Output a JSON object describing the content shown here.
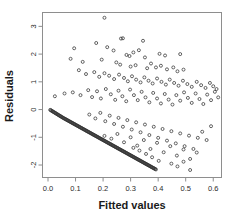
{
  "chart_data": {
    "type": "scatter",
    "title": "",
    "xlabel": "Fitted values",
    "ylabel": "Residuals",
    "xlim": [
      -0.02,
      0.63
    ],
    "ylim": [
      -2.45,
      3.5
    ],
    "xticks": [
      0.0,
      0.1,
      0.2,
      0.3,
      0.4,
      0.5,
      0.6
    ],
    "xticklabels": [
      "0.0",
      "0.1",
      "0.2",
      "0.3",
      "0.4",
      "0.5",
      "0.6"
    ],
    "yticks": [
      3,
      2,
      1,
      0,
      -1,
      -2
    ],
    "yticklabels": [
      "3",
      "2",
      "1",
      "0",
      "-1",
      "-2"
    ],
    "grid": false,
    "legend": null,
    "marker": "open-circle",
    "marker_size": 3.0,
    "marker_color": "#333333",
    "n_points": 404,
    "points": [
      [
        0.205,
        3.31
      ],
      [
        0.265,
        2.56
      ],
      [
        0.272,
        2.57
      ],
      [
        0.345,
        2.48
      ],
      [
        0.175,
        2.4
      ],
      [
        0.095,
        2.21
      ],
      [
        0.215,
        2.25
      ],
      [
        0.238,
        2.13
      ],
      [
        0.31,
        2.06
      ],
      [
        0.33,
        2.14
      ],
      [
        0.405,
        2.01
      ],
      [
        0.285,
        1.97
      ],
      [
        0.296,
        1.93
      ],
      [
        0.352,
        1.88
      ],
      [
        0.425,
        1.95
      ],
      [
        0.48,
        2.0
      ],
      [
        0.082,
        1.83
      ],
      [
        0.126,
        1.72
      ],
      [
        0.195,
        1.8
      ],
      [
        0.248,
        1.7
      ],
      [
        0.262,
        1.62
      ],
      [
        0.3,
        1.55
      ],
      [
        0.318,
        1.6
      ],
      [
        0.36,
        1.49
      ],
      [
        0.374,
        1.66
      ],
      [
        0.392,
        1.52
      ],
      [
        0.41,
        1.58
      ],
      [
        0.432,
        1.45
      ],
      [
        0.455,
        1.52
      ],
      [
        0.47,
        1.38
      ],
      [
        0.492,
        1.44
      ],
      [
        0.112,
        1.42
      ],
      [
        0.138,
        1.28
      ],
      [
        0.168,
        1.35
      ],
      [
        0.186,
        1.18
      ],
      [
        0.205,
        1.31
      ],
      [
        0.222,
        1.22
      ],
      [
        0.24,
        1.1
      ],
      [
        0.258,
        1.26
      ],
      [
        0.276,
        1.14
      ],
      [
        0.29,
        1.02
      ],
      [
        0.305,
        1.2
      ],
      [
        0.32,
        1.08
      ],
      [
        0.336,
        0.98
      ],
      [
        0.35,
        1.16
      ],
      [
        0.365,
        1.04
      ],
      [
        0.38,
        0.94
      ],
      [
        0.396,
        1.12
      ],
      [
        0.412,
        1.0
      ],
      [
        0.428,
        0.9
      ],
      [
        0.442,
        1.08
      ],
      [
        0.458,
        0.96
      ],
      [
        0.474,
        0.86
      ],
      [
        0.49,
        1.04
      ],
      [
        0.506,
        0.92
      ],
      [
        0.522,
        0.82
      ],
      [
        0.54,
        1.0
      ],
      [
        0.556,
        0.88
      ],
      [
        0.572,
        0.78
      ],
      [
        0.588,
        0.96
      ],
      [
        0.6,
        0.84
      ],
      [
        0.612,
        0.74
      ],
      [
        0.025,
        0.48
      ],
      [
        0.06,
        0.58
      ],
      [
        0.09,
        0.62
      ],
      [
        0.118,
        0.52
      ],
      [
        0.146,
        0.7
      ],
      [
        0.16,
        0.45
      ],
      [
        0.178,
        0.66
      ],
      [
        0.192,
        0.4
      ],
      [
        0.21,
        0.74
      ],
      [
        0.228,
        0.55
      ],
      [
        0.244,
        0.35
      ],
      [
        0.256,
        0.68
      ],
      [
        0.27,
        0.48
      ],
      [
        0.284,
        0.3
      ],
      [
        0.298,
        0.72
      ],
      [
        0.312,
        0.52
      ],
      [
        0.326,
        0.34
      ],
      [
        0.34,
        0.64
      ],
      [
        0.354,
        0.44
      ],
      [
        0.368,
        0.26
      ],
      [
        0.382,
        0.6
      ],
      [
        0.396,
        0.4
      ],
      [
        0.41,
        0.22
      ],
      [
        0.424,
        0.56
      ],
      [
        0.438,
        0.36
      ],
      [
        0.452,
        0.18
      ],
      [
        0.466,
        0.52
      ],
      [
        0.48,
        0.32
      ],
      [
        0.494,
        0.62
      ],
      [
        0.508,
        0.42
      ],
      [
        0.522,
        0.24
      ],
      [
        0.536,
        0.58
      ],
      [
        0.55,
        0.38
      ],
      [
        0.564,
        0.2
      ],
      [
        0.578,
        0.54
      ],
      [
        0.592,
        0.34
      ],
      [
        0.606,
        0.64
      ],
      [
        0.618,
        0.44
      ],
      [
        0.15,
        -0.18
      ],
      [
        0.172,
        -0.32
      ],
      [
        0.19,
        -0.12
      ],
      [
        0.208,
        -0.42
      ],
      [
        0.224,
        -0.22
      ],
      [
        0.24,
        -0.52
      ],
      [
        0.256,
        -0.3
      ],
      [
        0.272,
        -0.62
      ],
      [
        0.288,
        -0.38
      ],
      [
        0.304,
        -0.72
      ],
      [
        0.32,
        -0.46
      ],
      [
        0.336,
        -0.82
      ],
      [
        0.352,
        -0.54
      ],
      [
        0.368,
        -0.92
      ],
      [
        0.384,
        -0.62
      ],
      [
        0.4,
        -1.02
      ],
      [
        0.416,
        -0.7
      ],
      [
        0.432,
        -1.12
      ],
      [
        0.448,
        -0.78
      ],
      [
        0.464,
        -1.22
      ],
      [
        0.48,
        -0.86
      ],
      [
        0.496,
        -1.32
      ],
      [
        0.512,
        -0.94
      ],
      [
        0.528,
        -1.42
      ],
      [
        0.544,
        -1.02
      ],
      [
        0.56,
        -0.8
      ],
      [
        0.576,
        -1.1
      ],
      [
        0.592,
        -0.6
      ],
      [
        0.205,
        -0.95
      ],
      [
        0.23,
        -1.05
      ],
      [
        0.252,
        -0.88
      ],
      [
        0.276,
        -1.18
      ],
      [
        0.3,
        -1.0
      ],
      [
        0.324,
        -1.3
      ],
      [
        0.348,
        -1.1
      ],
      [
        0.372,
        -1.42
      ],
      [
        0.396,
        -1.2
      ],
      [
        0.42,
        -1.54
      ],
      [
        0.444,
        -1.32
      ],
      [
        0.468,
        -1.66
      ],
      [
        0.492,
        -1.44
      ],
      [
        0.516,
        -1.78
      ],
      [
        0.54,
        -1.55
      ],
      [
        0.448,
        -1.95
      ],
      [
        0.47,
        -2.05
      ],
      [
        0.492,
        -1.88
      ],
      [
        0.516,
        -2.18
      ],
      [
        0.402,
        -1.85
      ],
      [
        0.378,
        -1.72
      ],
      [
        0.356,
        -1.6
      ],
      [
        0.332,
        -1.48
      ],
      [
        0.31,
        -1.38
      ]
    ]
  }
}
